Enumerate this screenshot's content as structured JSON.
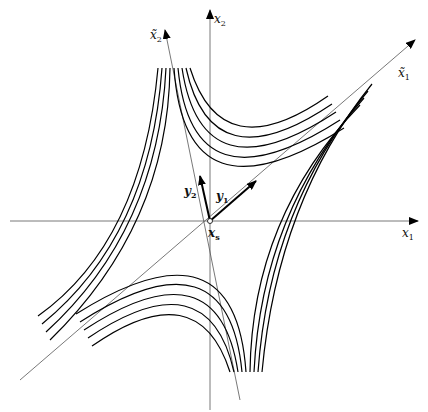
{
  "diagram": {
    "type": "saddle-point phase portrait",
    "origin_label": "x_s",
    "axes": [
      {
        "id": "x1",
        "label": "x",
        "sub": "1"
      },
      {
        "id": "x2",
        "label": "x",
        "sub": "2"
      },
      {
        "id": "xt1",
        "label": "x̃",
        "sub": "1"
      },
      {
        "id": "xt2",
        "label": "x̃",
        "sub": "2"
      }
    ],
    "eigenvectors": [
      {
        "id": "y1",
        "label": "y",
        "sub": "1"
      },
      {
        "id": "y2",
        "label": "y",
        "sub": "2"
      }
    ],
    "origin": {
      "label": "x",
      "sub": "s"
    }
  }
}
